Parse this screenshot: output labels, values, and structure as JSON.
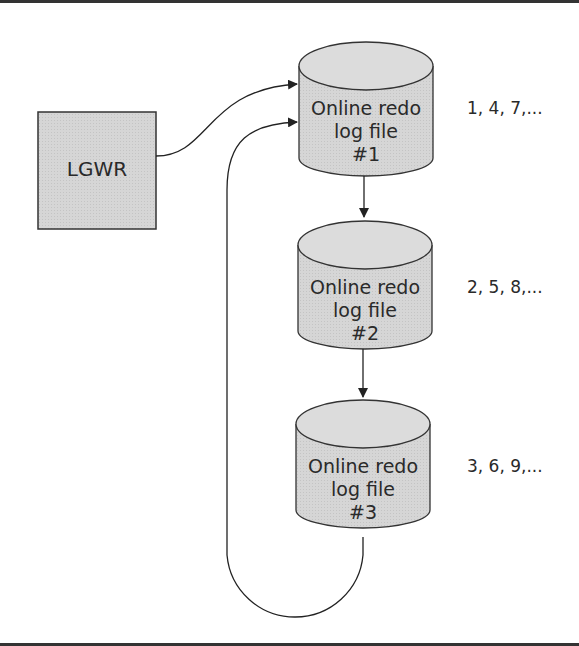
{
  "diagram": {
    "process": {
      "label": "LGWR"
    },
    "log_files": [
      {
        "line1": "Online redo",
        "line2": "log file",
        "number": "#1",
        "sequence": "1, 4, 7,..."
      },
      {
        "line1": "Online redo",
        "line2": "log file",
        "number": "#2",
        "sequence": "2, 5, 8,..."
      },
      {
        "line1": "Online redo",
        "line2": "log file",
        "number": "#3",
        "sequence": "3, 6, 9,..."
      }
    ],
    "colors": {
      "fill": "#d4d4d4",
      "stroke": "#333333",
      "rule": "#333333"
    }
  }
}
